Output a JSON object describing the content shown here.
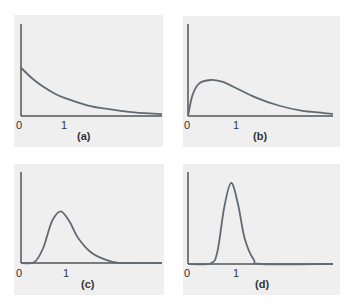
{
  "colors": {
    "background": "#efefef",
    "axis": "#555555",
    "curve": "#606a74"
  },
  "chart_data": [
    {
      "type": "line",
      "title": "(a)",
      "panel_label": "(a)",
      "description": "Exponentially decaying density starting at a finite value at x=0",
      "x_ticks": [
        "0",
        "1"
      ],
      "xlim": [
        0,
        3.2
      ],
      "x": [
        0,
        0.25,
        0.5,
        0.75,
        1,
        1.5,
        2,
        2.5,
        3,
        3.2
      ],
      "y": [
        1.0,
        0.78,
        0.61,
        0.47,
        0.37,
        0.22,
        0.14,
        0.08,
        0.05,
        0.04
      ],
      "ylim": [
        0,
        1.9
      ],
      "xlabel": "",
      "ylabel": "",
      "grid": false
    },
    {
      "type": "line",
      "title": "(b)",
      "panel_label": "(b)",
      "description": "Right-skewed density starting at 0, rising steeply to a low peak near x≈0.5 then decaying",
      "x_ticks": [
        "0",
        "1"
      ],
      "xlim": [
        0,
        3.2
      ],
      "x": [
        0,
        0.1,
        0.25,
        0.5,
        0.75,
        1,
        1.5,
        2,
        2.5,
        3,
        3.2
      ],
      "y": [
        0,
        0.5,
        0.78,
        0.86,
        0.82,
        0.7,
        0.44,
        0.25,
        0.13,
        0.07,
        0.05
      ],
      "ylim": [
        0,
        2.2
      ],
      "xlabel": "",
      "ylabel": "",
      "grid": false
    },
    {
      "type": "line",
      "title": "(c)",
      "panel_label": "(c)",
      "description": "Moderately peaked, right-skewed density with peak near x≈0.9",
      "x_ticks": [
        "0",
        "1"
      ],
      "xlim": [
        0,
        3.2
      ],
      "x": [
        0,
        0.3,
        0.5,
        0.7,
        0.9,
        1.1,
        1.3,
        1.6,
        2.0,
        2.3,
        3.2
      ],
      "y": [
        0,
        0.02,
        0.35,
        1.0,
        1.25,
        1.0,
        0.6,
        0.25,
        0.05,
        0.0,
        0.0
      ],
      "ylim": [
        0,
        2.2
      ],
      "xlabel": "",
      "ylabel": "",
      "grid": false
    },
    {
      "type": "line",
      "title": "(d)",
      "panel_label": "(d)",
      "description": "Narrow, tall, nearly symmetric density with peak near x≈0.95",
      "x_ticks": [
        "0",
        "1"
      ],
      "xlim": [
        0,
        3.2
      ],
      "x": [
        0,
        0.5,
        0.65,
        0.8,
        0.95,
        1.1,
        1.25,
        1.45,
        1.65,
        3.2
      ],
      "y": [
        0,
        0.02,
        0.35,
        1.55,
        2.2,
        1.65,
        0.7,
        0.12,
        0.0,
        0.0
      ],
      "ylim": [
        0,
        2.5
      ],
      "xlabel": "",
      "ylabel": "",
      "grid": false
    }
  ]
}
